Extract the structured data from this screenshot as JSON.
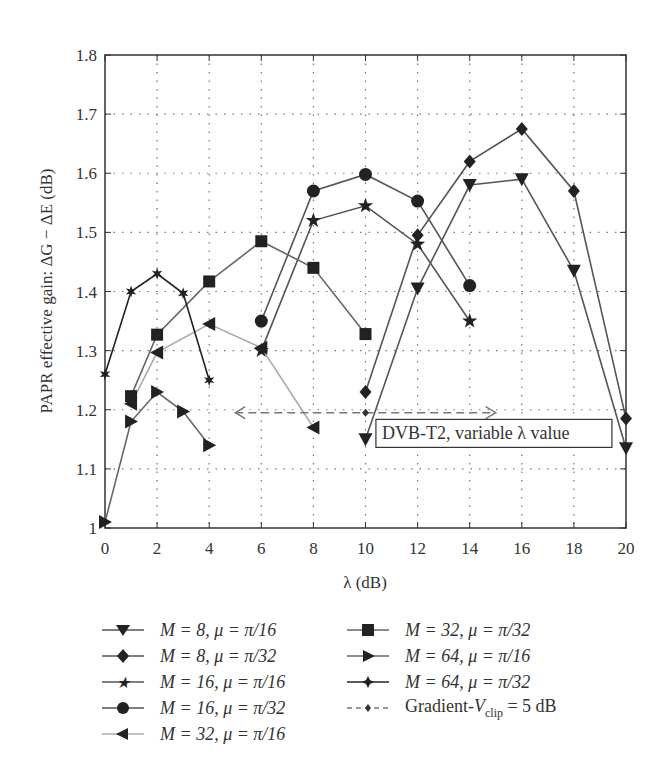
{
  "chart_data": {
    "type": "line",
    "title": "",
    "xlabel": "λ (dB)",
    "ylabel": "PAPR effective gain: ΔG − ΔE (dB)",
    "xlim": [
      0,
      20
    ],
    "ylim": [
      1.0,
      1.8
    ],
    "xticks": [
      0,
      2,
      4,
      6,
      8,
      10,
      12,
      14,
      16,
      18,
      20
    ],
    "yticks": [
      1,
      1.1,
      1.2,
      1.3,
      1.4,
      1.5,
      1.6,
      1.7,
      1.8
    ],
    "xtick_labels": [
      "0",
      "2",
      "4",
      "6",
      "8",
      "10",
      "12",
      "14",
      "16",
      "18",
      "20"
    ],
    "ytick_labels": [
      "1",
      "1.1",
      "1.2",
      "1.3",
      "1.4",
      "1.5",
      "1.6",
      "1.7",
      "1.8"
    ],
    "grid": true,
    "legend_position": "below",
    "series": [
      {
        "name": "M = 8, μ = π/16",
        "marker": "triangle-down",
        "color": "#555555",
        "x": [
          10,
          12,
          14,
          16,
          18,
          20
        ],
        "y": [
          1.15,
          1.405,
          1.58,
          1.59,
          1.435,
          1.135
        ]
      },
      {
        "name": "M = 8, μ = π/32",
        "marker": "diamond",
        "color": "#555555",
        "x": [
          10,
          12,
          14,
          16,
          18,
          20
        ],
        "y": [
          1.23,
          1.495,
          1.62,
          1.675,
          1.57,
          1.185
        ]
      },
      {
        "name": "M = 16, μ = π/16",
        "marker": "star",
        "color": "#555555",
        "x": [
          6,
          8,
          10,
          12,
          14
        ],
        "y": [
          1.3,
          1.52,
          1.545,
          1.48,
          1.35
        ]
      },
      {
        "name": "M = 16, μ = π/32",
        "marker": "circle",
        "color": "#555555",
        "x": [
          6,
          8,
          10,
          12,
          14
        ],
        "y": [
          1.35,
          1.57,
          1.598,
          1.553,
          1.41
        ]
      },
      {
        "name": "M = 32, μ = π/16",
        "marker": "triangle-left",
        "color": "#aaaaaa",
        "x": [
          1,
          2,
          4,
          6,
          8
        ],
        "y": [
          1.21,
          1.297,
          1.345,
          1.305,
          1.17
        ]
      },
      {
        "name": "M = 32, μ = π/32",
        "marker": "square",
        "color": "#666666",
        "x": [
          1,
          2,
          4,
          6,
          8,
          10
        ],
        "y": [
          1.223,
          1.327,
          1.417,
          1.485,
          1.44,
          1.328
        ]
      },
      {
        "name": "M = 64, μ = π/16",
        "marker": "triangle-right",
        "color": "#666666",
        "x": [
          0,
          1,
          2,
          3,
          4
        ],
        "y": [
          1.01,
          1.18,
          1.23,
          1.197,
          1.14
        ]
      },
      {
        "name": "M = 64, μ = π/32",
        "marker": "small-star",
        "color": "#222222",
        "x": [
          0,
          1,
          2,
          3,
          4
        ],
        "y": [
          1.26,
          1.4,
          1.43,
          1.397,
          1.25
        ]
      },
      {
        "name": "Gradient-Vclip = 5 dB",
        "marker": "small-diamond",
        "color": "#777777",
        "dashed": true,
        "x": [
          10
        ],
        "y": [
          1.195
        ],
        "range_x": [
          5,
          15
        ]
      }
    ],
    "annotations": [
      {
        "text": "DVB-T2, variable λ value",
        "x": 10.4,
        "y": 1.16,
        "boxed": true
      }
    ]
  },
  "legend": {
    "items": [
      {
        "label": "M = 8, μ = π/16"
      },
      {
        "label": "M = 8, μ = π/32"
      },
      {
        "label": "M = 16, μ = π/16"
      },
      {
        "label": "M = 16, μ = π/32"
      },
      {
        "label": "M = 32, μ = π/16"
      },
      {
        "label": "M = 32, μ = π/32"
      },
      {
        "label": "M = 64, μ = π/16"
      },
      {
        "label": "M = 64, μ = π/32"
      },
      {
        "label_prefix": "Gradient-",
        "label_var": "V",
        "label_sub": "clip",
        "label_suffix": " = 5 dB"
      }
    ]
  }
}
